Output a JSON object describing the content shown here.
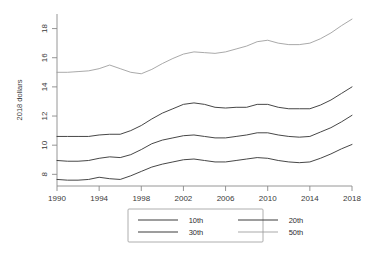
{
  "chart_data": {
    "type": "line",
    "title": "",
    "xlabel": "",
    "ylabel": "2018 dollars",
    "xlim": [
      1990,
      2018
    ],
    "ylim": [
      7.2,
      19.0
    ],
    "grid": false,
    "legend_position": "bottom-center",
    "xticks": [
      1990,
      1994,
      1998,
      2002,
      2006,
      2010,
      2014,
      2018
    ],
    "yticks": [
      8,
      10,
      12,
      14,
      16,
      18
    ],
    "x": [
      1990,
      1991,
      1992,
      1993,
      1994,
      1995,
      1996,
      1997,
      1998,
      1999,
      2000,
      2001,
      2002,
      2003,
      2004,
      2005,
      2006,
      2007,
      2008,
      2009,
      2010,
      2011,
      2012,
      2013,
      2014,
      2015,
      2016,
      2017,
      2018
    ],
    "series": [
      {
        "name": "10th",
        "color": "#3c3c3c",
        "values": [
          7.65,
          7.6,
          7.6,
          7.65,
          7.8,
          7.7,
          7.65,
          7.9,
          8.2,
          8.5,
          8.7,
          8.85,
          9.0,
          9.05,
          8.95,
          8.85,
          8.85,
          8.95,
          9.05,
          9.15,
          9.1,
          8.95,
          8.85,
          8.8,
          8.85,
          9.1,
          9.4,
          9.75,
          10.05
        ]
      },
      {
        "name": "20th",
        "color": "#3c3c3c",
        "values": [
          8.95,
          8.9,
          8.9,
          8.95,
          9.1,
          9.2,
          9.15,
          9.35,
          9.7,
          10.1,
          10.35,
          10.5,
          10.65,
          10.7,
          10.6,
          10.5,
          10.5,
          10.6,
          10.7,
          10.85,
          10.85,
          10.7,
          10.6,
          10.55,
          10.6,
          10.9,
          11.2,
          11.6,
          12.05
        ]
      },
      {
        "name": "30th",
        "color": "#3c3c3c",
        "values": [
          10.6,
          10.6,
          10.6,
          10.6,
          10.7,
          10.75,
          10.75,
          11.0,
          11.35,
          11.8,
          12.2,
          12.5,
          12.8,
          12.9,
          12.8,
          12.6,
          12.55,
          12.6,
          12.6,
          12.8,
          12.8,
          12.6,
          12.5,
          12.5,
          12.5,
          12.75,
          13.1,
          13.55,
          14.0
        ]
      },
      {
        "name": "50th",
        "color": "#9a9a9a",
        "values": [
          15.0,
          15.0,
          15.05,
          15.1,
          15.25,
          15.5,
          15.25,
          15.0,
          14.9,
          15.2,
          15.6,
          15.95,
          16.25,
          16.4,
          16.35,
          16.3,
          16.4,
          16.6,
          16.8,
          17.1,
          17.2,
          17.0,
          16.9,
          16.9,
          17.0,
          17.3,
          17.7,
          18.2,
          18.65
        ]
      }
    ]
  },
  "legend": {
    "entries": [
      {
        "label": "10th"
      },
      {
        "label": "20th"
      },
      {
        "label": "30th"
      },
      {
        "label": "50th"
      }
    ]
  }
}
